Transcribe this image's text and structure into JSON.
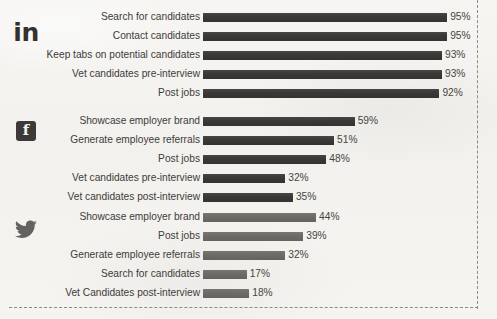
{
  "chart_data": {
    "type": "bar",
    "title": "",
    "xlabel": "",
    "ylabel": "",
    "orientation": "horizontal",
    "grid": false,
    "legend": "none",
    "value_suffix": "%",
    "xlim": [
      0,
      100
    ],
    "groups": [
      {
        "name": "LinkedIn",
        "icon": "linkedin-icon",
        "icon_glyph": "in",
        "bar_color": "#3a3937",
        "categories": [
          "Search for candidates",
          "Contact candidates",
          "Keep tabs on potential candidates",
          "Vet candidates pre-interview",
          "Post jobs"
        ],
        "values": [
          95,
          95,
          93,
          93,
          92
        ],
        "value_labels": [
          "95%",
          "95%",
          "93%",
          "93%",
          "92%"
        ]
      },
      {
        "name": "Facebook",
        "icon": "facebook-icon",
        "icon_glyph": "f",
        "bar_color": "#3a3937",
        "categories": [
          "Showcase employer brand",
          "Generate employee referrals",
          "Post jobs",
          "Vet candidates pre-interview",
          "Vet candidates post-interview"
        ],
        "values": [
          59,
          51,
          48,
          32,
          35
        ],
        "value_labels": [
          "59%",
          "51%",
          "48%",
          "32%",
          "35%"
        ]
      },
      {
        "name": "Twitter",
        "icon": "twitter-icon",
        "icon_glyph": "bird",
        "bar_color": "#6c6b67",
        "categories": [
          "Showcase employer brand",
          "Post jobs",
          "Generate employee referrals",
          "Search for candidates",
          "Vet Candidates post-interview"
        ],
        "values": [
          44,
          39,
          32,
          17,
          18
        ],
        "value_labels": [
          "44%",
          "39%",
          "32%",
          "17%",
          "18%"
        ]
      }
    ]
  },
  "style": {
    "background": "#f4f3f0",
    "label_color": "#3d3c3a",
    "value_color": "#46453f",
    "border_color": "#8e8b86",
    "bar_dark": "#3a3937",
    "bar_mid": "#6c6b67"
  }
}
